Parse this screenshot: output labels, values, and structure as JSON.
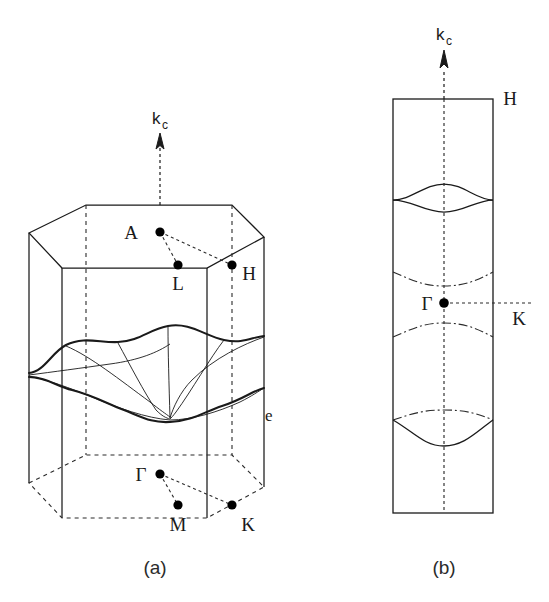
{
  "figure": {
    "type": "scientific-diagram",
    "panels": [
      {
        "id": "a",
        "label": "(a)",
        "description": "three-dimensional hexagonal Brillouin zone prism containing a corrugated Fermi surface sheet",
        "axis_label": "k",
        "axis_subscript": "c",
        "symmetry_points": [
          {
            "name": "A",
            "label": "A",
            "label_side": "left"
          },
          {
            "name": "L",
            "label": "L",
            "label_side": "below"
          },
          {
            "name": "H",
            "label": "H",
            "label_side": "right"
          },
          {
            "name": "Gamma",
            "label": "Γ",
            "label_side": "left"
          },
          {
            "name": "M",
            "label": "M",
            "label_side": "below"
          },
          {
            "name": "K",
            "label": "K",
            "label_side": "right"
          }
        ],
        "edge_label": "e"
      },
      {
        "id": "b",
        "label": "(b)",
        "description": "vertical cross-section of the Brillouin zone through the Gamma-K-H-A plane showing Fermi surface contours",
        "axis_label": "k",
        "axis_subscript": "c",
        "symmetry_points": [
          {
            "name": "H",
            "label": "H",
            "label_side": "right"
          },
          {
            "name": "Gamma",
            "label": "Γ",
            "label_side": "left"
          },
          {
            "name": "K",
            "label": "K",
            "label_side": "right"
          }
        ]
      }
    ],
    "colors": {
      "line": "#1a1a1a",
      "dashed": "#2b2b2b",
      "background": "#ffffff",
      "point": "#000000"
    }
  },
  "caption_cut": " "
}
